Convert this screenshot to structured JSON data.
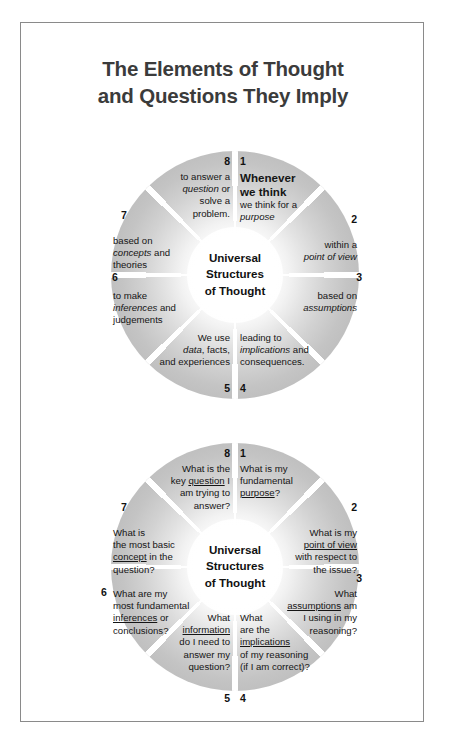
{
  "page": {
    "title_line1": "The Elements of Thought",
    "title_line2": "and Questions They Imply"
  },
  "wheel_top": {
    "center_line1": "Universal",
    "center_line2": "Structures",
    "center_line3": "of Thought",
    "segments": [
      {
        "number": "1",
        "lead": "Whenever we think",
        "text": "we think for a purpose",
        "emphasis": "purpose"
      },
      {
        "number": "2",
        "text": "within a point of view",
        "emphasis": "point of view"
      },
      {
        "number": "3",
        "text": "based on assumptions",
        "emphasis": "assumptions"
      },
      {
        "number": "4",
        "text": "leading to implications and consequences.",
        "emphasis": "implications"
      },
      {
        "number": "5",
        "text": "We use data, facts, and experiences",
        "emphasis": "data"
      },
      {
        "number": "6",
        "text": "to make inferences and judgements",
        "emphasis": "inferences"
      },
      {
        "number": "7",
        "text": "based on concepts and theories",
        "emphasis": "concepts"
      },
      {
        "number": "8",
        "text": "to answer a question or solve a problem.",
        "emphasis": "question"
      }
    ]
  },
  "wheel_bottom": {
    "center_line1": "Universal",
    "center_line2": "Structures",
    "center_line3": "of Thought",
    "segments": [
      {
        "number": "1",
        "text": "What is my fundamental purpose?",
        "emphasis": "purpose"
      },
      {
        "number": "2",
        "text": "What is my point of view with respect to the issue?",
        "emphasis": "point of view"
      },
      {
        "number": "3",
        "text": "What assumptions am I using in my reasoning?",
        "emphasis": "assumptions"
      },
      {
        "number": "4",
        "text": "What are the implications of my reasoning (if I am correct)?",
        "emphasis": "implications"
      },
      {
        "number": "5",
        "text": "What information do I need to answer my question?",
        "emphasis": "information"
      },
      {
        "number": "6",
        "text": "What are my most fundamental inferences or conclusions?",
        "emphasis": "inferences"
      },
      {
        "number": "7",
        "text": "What is the most basic concept in the question?",
        "emphasis": "concept"
      },
      {
        "number": "8",
        "text": "What is the key question I am trying to answer?",
        "emphasis": "question"
      }
    ]
  },
  "colors": {
    "border": "#8a8a8a",
    "title": "#3b3b3b",
    "wheel_edge": "#b0b0b0",
    "text": "#151515"
  }
}
